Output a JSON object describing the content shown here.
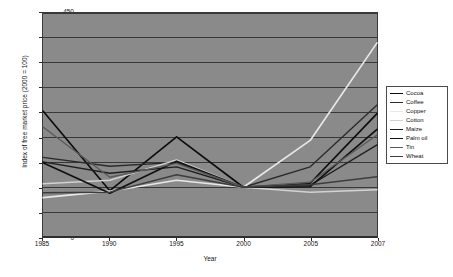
{
  "chart_data": {
    "type": "line",
    "title": "",
    "xlabel": "Year",
    "ylabel": "Index of free market price (2000 = 100)",
    "categories": [
      "1985",
      "1990",
      "1995",
      "2000",
      "2005",
      "2007"
    ],
    "ylim": [
      0,
      450
    ],
    "ytick_step": 50,
    "yticks": [
      "0",
      "50",
      "100",
      "150",
      "200",
      "250",
      "300",
      "350",
      "400",
      "450"
    ],
    "grid": "horizontal",
    "legend_position": "right",
    "plot_background": "#8a8a8a",
    "series": [
      {
        "name": "Cocoa",
        "color": "#0d0d0d",
        "width": 1.7,
        "values": [
          253,
          93,
          201,
          100,
          108,
          248
        ]
      },
      {
        "name": "Coffee",
        "color": "#2b2b2b",
        "width": 1.4,
        "values": [
          160,
          142,
          150,
          100,
          141,
          265
        ]
      },
      {
        "name": "Copper",
        "color": "#e8e8e8",
        "width": 1.7,
        "values": [
          79,
          92,
          114,
          100,
          194,
          390
        ]
      },
      {
        "name": "Cotton",
        "color": "#d2d2d2",
        "width": 1.4,
        "values": [
          107,
          114,
          155,
          100,
          90,
          95
        ]
      },
      {
        "name": "Maize",
        "color": "#1f1f1f",
        "width": 1.4,
        "values": [
          151,
          128,
          141,
          100,
          104,
          185
        ]
      },
      {
        "name": "Palm oil",
        "color": "#101010",
        "width": 1.7,
        "values": [
          149,
          88,
          152,
          100,
          101,
          216
        ]
      },
      {
        "name": "Tin",
        "color": "#5a5a5a",
        "width": 1.4,
        "values": [
          221,
          120,
          148,
          100,
          110,
          205
        ]
      },
      {
        "name": "Wheat",
        "color": "#3d3d3d",
        "width": 1.4,
        "values": [
          89,
          90,
          125,
          100,
          105,
          121
        ]
      }
    ]
  }
}
